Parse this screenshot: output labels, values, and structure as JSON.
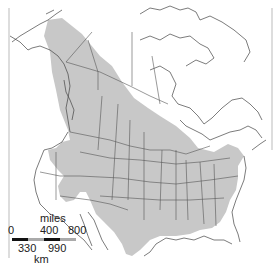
{
  "map": {
    "type": "range-distribution",
    "region": "North America",
    "colors": {
      "background": "#ffffff",
      "range_fill": "#c8c8c8",
      "borders": "#444444",
      "frame": "#999999"
    }
  },
  "scale": {
    "unit_top": "miles",
    "ticks_top": [
      "0",
      "400",
      "800"
    ],
    "ticks_bottom": [
      "330",
      "990"
    ],
    "unit_bottom": "km",
    "bar_colors": [
      "#111111",
      "#aaaaaa",
      "#111111",
      "#aaaaaa"
    ]
  }
}
